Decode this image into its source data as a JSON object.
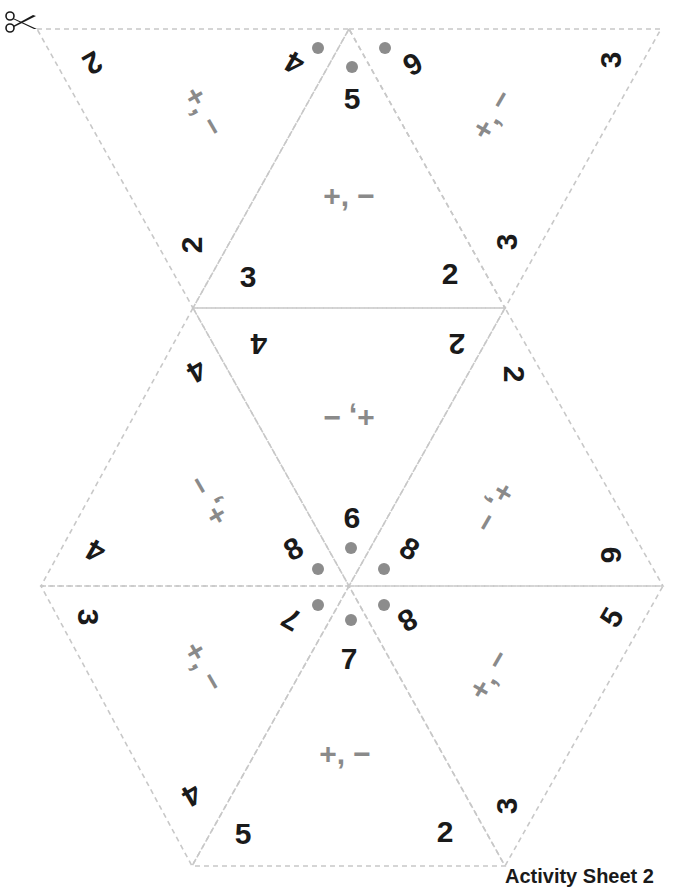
{
  "sheet": {
    "footer_label": "Activity Sheet 2",
    "line_color": "#c8c8c8",
    "number_color": "#1a1a1a",
    "operation_color": "#8a8a8a",
    "dot_color": "#8c8c8c",
    "cut_icon": "scissors-icon"
  },
  "triangles": [
    {
      "id": "t1",
      "orientation": "down",
      "vertices": [
        [
          37,
          29
        ],
        [
          349,
          29
        ],
        [
          193,
          308
        ]
      ],
      "numbers": [
        {
          "v": "2",
          "x": 92,
          "y": 62,
          "rot": 150
        },
        {
          "v": "4",
          "x": 295,
          "y": 62,
          "rot": 210
        },
        {
          "v": "2",
          "x": 193,
          "y": 245,
          "rot": -90
        }
      ],
      "ops": {
        "v": "+, −",
        "x": 203,
        "y": 112,
        "rot": 60
      }
    },
    {
      "id": "t2",
      "orientation": "up",
      "vertices": [
        [
          349,
          29
        ],
        [
          193,
          308
        ],
        [
          505,
          308
        ]
      ],
      "numbers": [
        {
          "v": "5",
          "x": 352,
          "y": 100,
          "rot": 0
        },
        {
          "v": "3",
          "x": 248,
          "y": 278,
          "rot": 0
        },
        {
          "v": "2",
          "x": 450,
          "y": 275,
          "rot": 0
        }
      ],
      "ops": {
        "v": "+, −",
        "x": 349,
        "y": 197,
        "rot": 0
      }
    },
    {
      "id": "t3",
      "orientation": "down",
      "vertices": [
        [
          349,
          29
        ],
        [
          661,
          29
        ],
        [
          505,
          308
        ]
      ],
      "numbers": [
        {
          "v": "6",
          "x": 412,
          "y": 63,
          "rot": 150
        },
        {
          "v": "3",
          "x": 612,
          "y": 60,
          "rot": -90
        },
        {
          "v": "3",
          "x": 508,
          "y": 242,
          "rot": -90
        }
      ],
      "ops": {
        "v": "+, −",
        "x": 493,
        "y": 115,
        "rot": -60
      }
    },
    {
      "id": "t4",
      "orientation": "up",
      "vertices": [
        [
          193,
          308
        ],
        [
          41,
          586
        ],
        [
          349,
          586
        ]
      ],
      "numbers": [
        {
          "v": "4",
          "x": 196,
          "y": 370,
          "rot": 150
        },
        {
          "v": "4",
          "x": 96,
          "y": 550,
          "rot": 210
        },
        {
          "v": "8",
          "x": 294,
          "y": 550,
          "rot": -30
        }
      ],
      "ops": {
        "v": "+, −",
        "x": 209,
        "y": 500,
        "rot": -120
      }
    },
    {
      "id": "t5",
      "orientation": "down",
      "vertices": [
        [
          193,
          308
        ],
        [
          505,
          308
        ],
        [
          349,
          586
        ]
      ],
      "numbers": [
        {
          "v": "4",
          "x": 259,
          "y": 343,
          "rot": 180
        },
        {
          "v": "2",
          "x": 457,
          "y": 343,
          "rot": 180
        },
        {
          "v": "9",
          "x": 352,
          "y": 517,
          "rot": 180
        }
      ],
      "ops": {
        "v": "+, −",
        "x": 349,
        "y": 417,
        "rot": 180
      }
    },
    {
      "id": "t6",
      "orientation": "up",
      "vertices": [
        [
          505,
          308
        ],
        [
          349,
          586
        ],
        [
          663,
          586
        ]
      ],
      "numbers": [
        {
          "v": "2",
          "x": 513,
          "y": 374,
          "rot": 90
        },
        {
          "v": "8",
          "x": 409,
          "y": 550,
          "rot": 30
        },
        {
          "v": "6",
          "x": 610,
          "y": 555,
          "rot": 90
        }
      ],
      "ops": {
        "v": "+, −",
        "x": 494,
        "y": 507,
        "rot": 120
      }
    },
    {
      "id": "t7",
      "orientation": "down",
      "vertices": [
        [
          41,
          586
        ],
        [
          349,
          586
        ],
        [
          192,
          866
        ]
      ],
      "numbers": [
        {
          "v": "3",
          "x": 87,
          "y": 617,
          "rot": 90
        },
        {
          "v": "7",
          "x": 292,
          "y": 618,
          "rot": 210
        },
        {
          "v": "4",
          "x": 191,
          "y": 794,
          "rot": 150
        }
      ],
      "ops": {
        "v": "+, −",
        "x": 203,
        "y": 667,
        "rot": 60
      }
    },
    {
      "id": "t8",
      "orientation": "up",
      "vertices": [
        [
          349,
          586
        ],
        [
          192,
          866
        ],
        [
          505,
          866
        ]
      ],
      "numbers": [
        {
          "v": "7",
          "x": 349,
          "y": 660,
          "rot": 0
        },
        {
          "v": "5",
          "x": 243,
          "y": 835,
          "rot": 0
        },
        {
          "v": "2",
          "x": 445,
          "y": 833,
          "rot": 0
        }
      ],
      "ops": {
        "v": "+, −",
        "x": 345,
        "y": 755,
        "rot": 0
      }
    },
    {
      "id": "t9",
      "orientation": "down",
      "vertices": [
        [
          349,
          586
        ],
        [
          663,
          586
        ],
        [
          505,
          866
        ]
      ],
      "numbers": [
        {
          "v": "8",
          "x": 407,
          "y": 619,
          "rot": 150
        },
        {
          "v": "5",
          "x": 613,
          "y": 618,
          "rot": -60
        },
        {
          "v": "3",
          "x": 508,
          "y": 806,
          "rot": -90
        }
      ],
      "ops": {
        "v": "+, −",
        "x": 490,
        "y": 675,
        "rot": -60
      }
    }
  ],
  "dots": [
    {
      "x": 318,
      "y": 48
    },
    {
      "x": 352,
      "y": 67
    },
    {
      "x": 385,
      "y": 48
    },
    {
      "x": 318,
      "y": 569
    },
    {
      "x": 351,
      "y": 548
    },
    {
      "x": 384,
      "y": 569
    },
    {
      "x": 318,
      "y": 605
    },
    {
      "x": 351,
      "y": 620
    },
    {
      "x": 384,
      "y": 605
    }
  ]
}
